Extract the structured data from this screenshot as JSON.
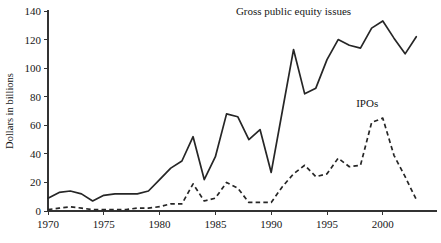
{
  "chart_data": {
    "type": "line",
    "title": "",
    "subtitle": "",
    "xlabel": "",
    "ylabel": "Dollars in billions",
    "xlim": [
      1970,
      2003
    ],
    "ylim": [
      0,
      140
    ],
    "grid": false,
    "legend_position": "inline-annotation",
    "x_ticks": [
      "1970",
      "1975",
      "1980",
      "1985",
      "1990",
      "1995",
      "2000"
    ],
    "x_tick_values": [
      1970,
      1975,
      1980,
      1985,
      1990,
      1995,
      2000
    ],
    "y_ticks": [
      "0",
      "20",
      "40",
      "60",
      "80",
      "100",
      "120",
      "140"
    ],
    "y_tick_values": [
      0,
      20,
      40,
      60,
      80,
      100,
      120,
      140
    ],
    "x": [
      1970,
      1971,
      1972,
      1973,
      1974,
      1975,
      1976,
      1977,
      1978,
      1979,
      1980,
      1981,
      1982,
      1983,
      1984,
      1985,
      1986,
      1987,
      1988,
      1989,
      1990,
      1991,
      1992,
      1993,
      1994,
      1995,
      1996,
      1997,
      1998,
      1999,
      2000,
      2001,
      2002,
      2003
    ],
    "series": [
      {
        "name": "Gross public equity issues",
        "style": "solid",
        "values": [
          9,
          13,
          14,
          12,
          7,
          11,
          12,
          12,
          12,
          14,
          22,
          30,
          35,
          52,
          22,
          38,
          68,
          66,
          50,
          57,
          27,
          70,
          113,
          82,
          86,
          106,
          120,
          116,
          114,
          128,
          133,
          121,
          110,
          122
        ]
      },
      {
        "name": "IPOs",
        "style": "dashed",
        "values": [
          1,
          2,
          3,
          2,
          1,
          1,
          1,
          1,
          2,
          2,
          3,
          5,
          5,
          19,
          7,
          9,
          20,
          16,
          6,
          6,
          6,
          17,
          26,
          32,
          24,
          26,
          37,
          31,
          32,
          62,
          65,
          39,
          24,
          8
        ]
      }
    ],
    "annotations": [
      {
        "text": "Gross public equity issues",
        "x": 1992.0,
        "y": 137
      },
      {
        "text": "IPOs",
        "x": 1998.6,
        "y": 73
      }
    ],
    "colors": {
      "series_stroke": "#262626",
      "axis": "#333333",
      "text": "#161616",
      "background": "#ffffff"
    }
  }
}
